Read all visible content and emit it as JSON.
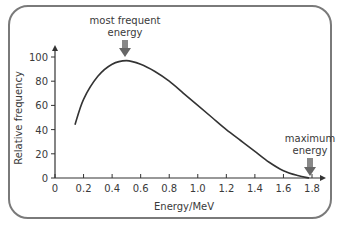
{
  "chart_data": {
    "type": "line",
    "title": "",
    "xlabel": "Energy/MeV",
    "ylabel": "Relative frequency",
    "xlim": [
      0,
      1.8
    ],
    "ylim": [
      0,
      100
    ],
    "xticks": [
      "0",
      "0.2",
      "0.4",
      "0.6",
      "0.8",
      "1.0",
      "1.2",
      "1.4",
      "1.6",
      "1.8"
    ],
    "yticks": [
      "0",
      "20",
      "40",
      "60",
      "80",
      "100"
    ],
    "grid": false,
    "series": [
      {
        "name": "beta energy spectrum",
        "x": [
          0.14,
          0.2,
          0.3,
          0.4,
          0.5,
          0.6,
          0.7,
          0.8,
          0.9,
          1.0,
          1.1,
          1.2,
          1.3,
          1.4,
          1.5,
          1.6,
          1.7,
          1.78
        ],
        "y": [
          44,
          65,
          84,
          94,
          97,
          94,
          88,
          80,
          70,
          60,
          50,
          40,
          31,
          22,
          13,
          6,
          2,
          0
        ]
      }
    ],
    "annotations": [
      {
        "text": "most frequent energy",
        "x": 0.5,
        "y": 97,
        "arrow": "down"
      },
      {
        "text": "maximum energy",
        "x": 1.78,
        "y": 0,
        "arrow": "down"
      }
    ]
  },
  "labels": {
    "xlabel": "Energy/MeV",
    "ylabel": "Relative frequency",
    "ann1_line1": "most frequent",
    "ann1_line2": "energy",
    "ann2_line1": "maximum",
    "ann2_line2": "energy"
  }
}
